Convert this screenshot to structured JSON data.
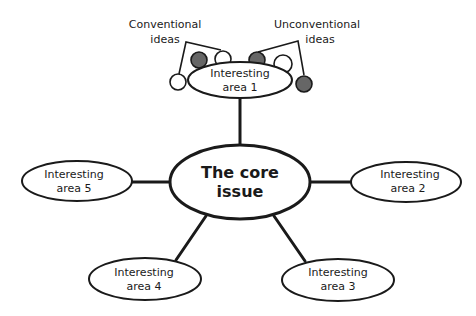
{
  "diagram": {
    "core": {
      "line1": "The core",
      "line2": "issue"
    },
    "areas": [
      {
        "line1": "Interesting",
        "line2": "area 1"
      },
      {
        "line1": "Interesting",
        "line2": "area 2"
      },
      {
        "line1": "Interesting",
        "line2": "area 3"
      },
      {
        "line1": "Interesting",
        "line2": "area 4"
      },
      {
        "line1": "Interesting",
        "line2": "area 5"
      }
    ],
    "labels": {
      "conventional_line1": "Conventional",
      "conventional_line2": "ideas",
      "unconventional_line1": "Unconventional",
      "unconventional_line2": "ideas"
    },
    "colors": {
      "stroke": "#1a1a1a",
      "dark_circle": "#666666",
      "light_circle": "#ffffff",
      "background": "#ffffff"
    }
  }
}
